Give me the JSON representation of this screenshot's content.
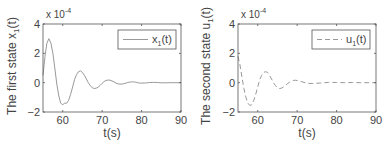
{
  "chart_data": [
    {
      "type": "line",
      "title": "",
      "xlabel": "t(s)",
      "ylabel": "The first state x_1(t)",
      "ylabel_main": "The first state x",
      "ylabel_sub": "1",
      "ylabel_tail": "(t)",
      "y_multiplier": "x 10",
      "y_multiplier_exp": "-4",
      "xlim": [
        55,
        90
      ],
      "ylim": [
        -2,
        4
      ],
      "xticks": [
        60,
        70,
        80,
        90
      ],
      "yticks": [
        -2,
        0,
        2,
        4
      ],
      "grid": false,
      "legend_position": "upper right",
      "series": [
        {
          "name": "x_1(t)",
          "legend_main": "x",
          "legend_sub": "1",
          "legend_tail": "(t)",
          "style": "solid",
          "x": [
            55,
            55.5,
            56,
            56.5,
            57,
            57.5,
            58,
            58.5,
            59,
            59.5,
            60,
            60.5,
            61,
            61.5,
            62,
            62.5,
            63,
            63.5,
            64,
            64.5,
            65,
            65.5,
            66,
            66.5,
            67,
            67.5,
            68,
            68.5,
            69,
            69.5,
            70,
            70.5,
            71,
            71.5,
            72,
            72.5,
            73,
            73.5,
            74,
            74.5,
            75,
            75.5,
            76,
            76.5,
            77,
            77.5,
            78,
            78.5,
            79,
            79.5,
            80,
            81,
            82,
            83,
            84,
            85,
            86,
            87,
            88,
            89,
            90
          ],
          "values": [
            0.5,
            1.8,
            2.7,
            3.0,
            2.7,
            2.0,
            1.0,
            -0.1,
            -0.9,
            -1.4,
            -1.5,
            -1.4,
            -1.4,
            -1.2,
            -0.8,
            -0.3,
            0.2,
            0.55,
            0.75,
            0.8,
            0.7,
            0.5,
            0.25,
            0.0,
            -0.2,
            -0.35,
            -0.4,
            -0.38,
            -0.3,
            -0.18,
            -0.05,
            0.08,
            0.15,
            0.18,
            0.17,
            0.12,
            0.05,
            -0.02,
            -0.08,
            -0.1,
            -0.1,
            -0.07,
            -0.03,
            0.01,
            0.04,
            0.05,
            0.05,
            0.03,
            0.0,
            -0.02,
            -0.03,
            -0.02,
            0.01,
            0.02,
            0.01,
            -0.01,
            -0.01,
            0.0,
            0.0,
            0.0,
            0.0
          ]
        }
      ]
    },
    {
      "type": "line",
      "title": "",
      "xlabel": "t(s)",
      "ylabel": "The second state u_1(t)",
      "ylabel_main": "The second state u",
      "ylabel_sub": "1",
      "ylabel_tail": "(t)",
      "y_multiplier": "x 10",
      "y_multiplier_exp": "-4",
      "xlim": [
        55,
        90
      ],
      "ylim": [
        -2,
        4
      ],
      "xticks": [
        60,
        70,
        80,
        90
      ],
      "yticks": [
        -2,
        0,
        2,
        4
      ],
      "grid": false,
      "legend_position": "upper right",
      "series": [
        {
          "name": "u_1(t)",
          "legend_main": "u",
          "legend_sub": "1",
          "legend_tail": "(t)",
          "style": "dashed",
          "x": [
            55,
            55.5,
            56,
            56.5,
            57,
            57.5,
            58,
            58.5,
            59,
            59.5,
            60,
            60.5,
            61,
            61.5,
            62,
            62.5,
            63,
            63.5,
            64,
            64.5,
            65,
            65.5,
            66,
            66.5,
            67,
            67.5,
            68,
            68.5,
            69,
            69.5,
            70,
            71,
            72,
            73,
            74,
            75,
            76,
            77,
            78,
            79,
            80,
            82,
            84,
            86,
            88,
            90
          ],
          "values": [
            1.8,
            1.2,
            0.4,
            -0.4,
            -1.0,
            -1.4,
            -1.55,
            -1.5,
            -1.2,
            -0.8,
            -0.3,
            0.2,
            0.5,
            0.7,
            0.75,
            0.7,
            0.5,
            0.25,
            0.0,
            -0.2,
            -0.35,
            -0.4,
            -0.38,
            -0.3,
            -0.2,
            -0.08,
            0.02,
            0.1,
            0.15,
            0.17,
            0.15,
            0.08,
            0.0,
            -0.05,
            -0.06,
            -0.04,
            -0.02,
            0.0,
            0.02,
            0.02,
            0.01,
            0.0,
            0.01,
            0.0,
            0.0,
            0.0
          ]
        }
      ]
    }
  ],
  "colors": {
    "axis": "#555555",
    "line": "#999999",
    "text": "#444444"
  }
}
